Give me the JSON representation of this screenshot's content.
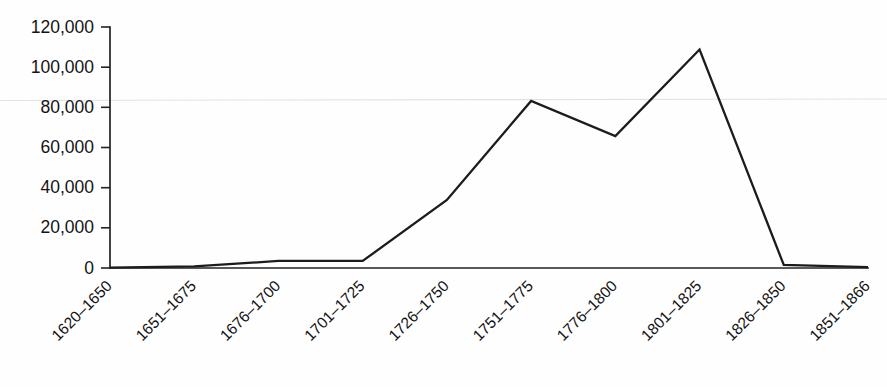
{
  "chart_data": {
    "type": "line",
    "title": "",
    "subtitle": "",
    "xlabel": "",
    "ylabel": "",
    "categories": [
      "1620–1650",
      "1651–1675",
      "1676–1700",
      "1701–1725",
      "1726–1750",
      "1751–1775",
      "1776–1800",
      "1801–1825",
      "1826–1850",
      "1851–1866"
    ],
    "values": [
      200,
      800,
      3500,
      3500,
      33900,
      83200,
      65700,
      108800,
      1500,
      400
    ],
    "series": [
      {
        "name": "",
        "values": [
          200,
          800,
          3500,
          3500,
          33900,
          83200,
          65700,
          108800,
          1500,
          400
        ]
      }
    ],
    "ylim": [
      0,
      120000
    ],
    "ytick_values": [
      0,
      20000,
      40000,
      60000,
      80000,
      100000,
      120000
    ],
    "ytick_labels": [
      "0",
      "20,000",
      "40,000",
      "60,000",
      "80,000",
      "100,000",
      "120,000"
    ],
    "grid": false,
    "legend": false,
    "legend_position": "none",
    "line_color": "#1c1c1c",
    "axis_color": "#222222",
    "background_color": "#ffffff",
    "xtick_rotation_degrees": -45
  }
}
